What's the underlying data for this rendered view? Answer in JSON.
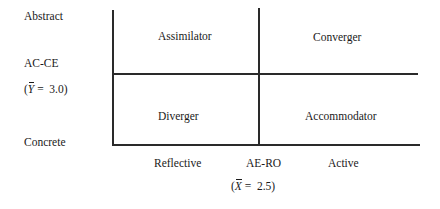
{
  "diagram": {
    "type": "2x2 quadrant",
    "y_axis": {
      "top_label": "Abstract",
      "bottom_label": "Concrete",
      "dimension_label": "AC-CE",
      "mean_label_prefix": "(",
      "mean_symbol": "Y",
      "mean_label_suffix": " =  3.0)",
      "mean_value": 3.0
    },
    "x_axis": {
      "left_label": "Reflective",
      "center_label": "AE-RO",
      "right_label": "Active",
      "mean_label_prefix": "(",
      "mean_symbol": "X",
      "mean_label_suffix": " =  2.5)",
      "mean_value": 2.5
    },
    "quadrants": {
      "top_left": "Assimilator",
      "top_right": "Converger",
      "bottom_left": "Diverger",
      "bottom_right": "Accommodator"
    },
    "colors": {
      "line": "#2a2a2a",
      "text": "#1a1a1a",
      "background": "#ffffff"
    }
  }
}
